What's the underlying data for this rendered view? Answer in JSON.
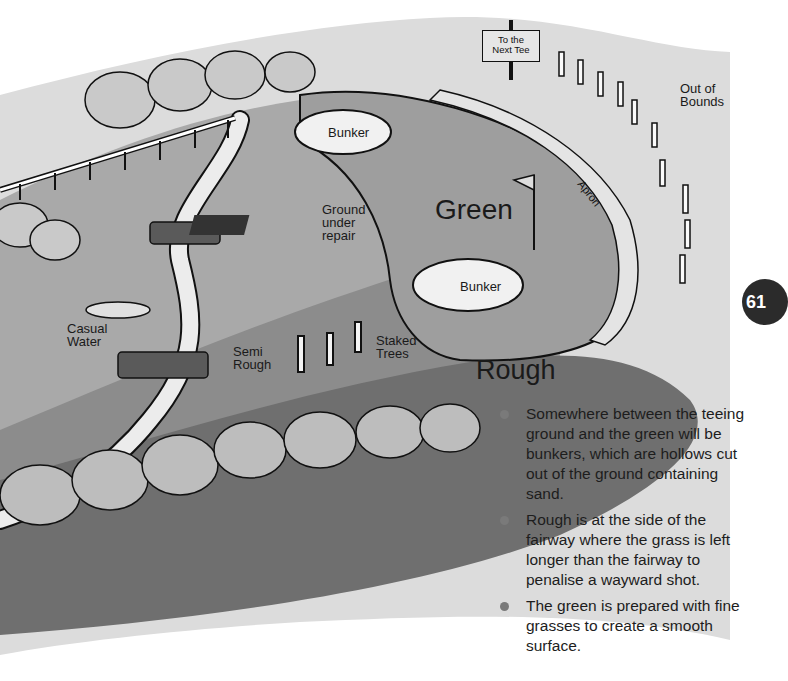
{
  "page": {
    "number": "61",
    "colors": {
      "background": "#ffffff",
      "sky_band": "#dcdcdc",
      "fairway": "#a9a9a9",
      "green": "#9e9e9e",
      "semi_rough": "#8c8c8c",
      "rough": "#6f6f6f",
      "bunker_sand": "#f1f1f1",
      "badge": "#2b2b2b",
      "bullet": "#7a7a7a"
    }
  },
  "diagram": {
    "sign": {
      "line1": "To the",
      "line2": "Next Tee"
    },
    "labels": {
      "out_of_bounds_1": "Out of",
      "out_of_bounds_2": "Bounds",
      "bunker_top": "Bunker",
      "bunker_bottom": "Bunker",
      "green": "Green",
      "apron": "Apron",
      "ground_1": "Ground",
      "ground_2": "under",
      "ground_3": "repair",
      "casual_1": "Casual",
      "casual_2": "Water",
      "semi_1": "Semi",
      "semi_2": "Rough",
      "staked_1": "Staked",
      "staked_2": "Trees",
      "rough": "Rough"
    }
  },
  "notes": {
    "bullets": [
      "Somewhere between the teeing ground and the green will be bunkers, which are hollows cut out of the ground containing sand.",
      "Rough is at the side of the fairway where the grass is left longer than the fairway to penalise a wayward shot.",
      "The green is prepared with fine grasses to create a smooth surface."
    ]
  }
}
